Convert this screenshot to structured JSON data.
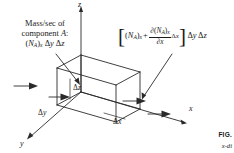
{
  "figure": {
    "title_fragment": "FIG.",
    "caption_fragment": "x-di",
    "left_caption": {
      "line1": "Mass/sec of",
      "line2_pre": "component",
      "line2_var": "A",
      "line2_post": ":",
      "line3": "(N_A)_x Δy Δz"
    },
    "expression": {
      "open_bracket": "[",
      "term1_base": "(N",
      "term1_sub": "A",
      "term1_close": ")",
      "term1_subx": "x",
      "plus": "+",
      "numerator": "∂(N",
      "numerator_sub": "A",
      "numerator_close": ")",
      "numerator_subx": "x",
      "denominator_d": "∂",
      "denominator_x": "x",
      "delta_x": "Δx",
      "close_bracket": "]",
      "delta_y": "Δy",
      "delta_z": "Δz"
    },
    "axes": {
      "z": "z",
      "y": "y",
      "x": "x"
    },
    "dimensions": {
      "dz": "Δz",
      "dy": "Δy",
      "dx": "Δx"
    },
    "colors": {
      "ink": "#1a1a1a",
      "background": "#ffffff"
    }
  }
}
